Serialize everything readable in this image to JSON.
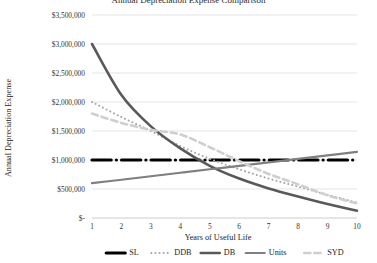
{
  "chart_data": {
    "type": "line",
    "title": "Annual Depreciation Expense Comparison",
    "xlabel": "Years of Useful Life",
    "ylabel": "Annual Depreciation Expense",
    "x": [
      1,
      2,
      3,
      4,
      5,
      6,
      7,
      8,
      9,
      10
    ],
    "xtick_labels": [
      "1",
      "2",
      "3",
      "4",
      "5",
      "6",
      "7",
      "8",
      "9",
      "10"
    ],
    "ytick_labels": [
      "$3,500,000",
      "$3,000,000",
      "$2,500,000",
      "$2,000,000",
      "$1,500,000",
      "$1,000,000",
      "$500,000",
      "$-"
    ],
    "ytick_values": [
      3500000,
      3000000,
      2500000,
      2000000,
      1500000,
      1000000,
      500000,
      0
    ],
    "ylim": [
      0,
      3500000
    ],
    "xlim": [
      1,
      10
    ],
    "grid": true,
    "legend_position": "bottom",
    "series": [
      {
        "name": "SL",
        "color": "#000000",
        "style": "dash-dot",
        "width": 3.2,
        "values": [
          1000000,
          1000000,
          1000000,
          1000000,
          1000000,
          1000000,
          1000000,
          1000000,
          1000000,
          1000000
        ]
      },
      {
        "name": "DDB",
        "color": "#a6a6a6",
        "style": "dotted",
        "width": 2.0,
        "values": [
          2000000,
          1740000,
          1500000,
          1240000,
          1020000,
          840000,
          680000,
          540000,
          400000,
          265000
        ]
      },
      {
        "name": "DB",
        "color": "#595959",
        "style": "solid",
        "width": 2.6,
        "values": [
          3000000,
          2120000,
          1580000,
          1200000,
          900000,
          680000,
          510000,
          370000,
          240000,
          125000
        ]
      },
      {
        "name": "Units",
        "color": "#7f7f7f",
        "style": "solid",
        "width": 2.2,
        "values": [
          600000,
          660000,
          720000,
          780000,
          840000,
          900000,
          960000,
          1020000,
          1080000,
          1140000
        ]
      },
      {
        "name": "SYD",
        "color": "#cfcfcf",
        "style": "dashed",
        "width": 2.6,
        "values": [
          1800000,
          1640000,
          1520000,
          1440000,
          1220000,
          980000,
          760000,
          580000,
          390000,
          250000
        ]
      }
    ]
  },
  "legend": {
    "items": [
      {
        "label": "SL"
      },
      {
        "label": "DDB"
      },
      {
        "label": "DB"
      },
      {
        "label": "Units"
      },
      {
        "label": "SYD"
      }
    ]
  }
}
